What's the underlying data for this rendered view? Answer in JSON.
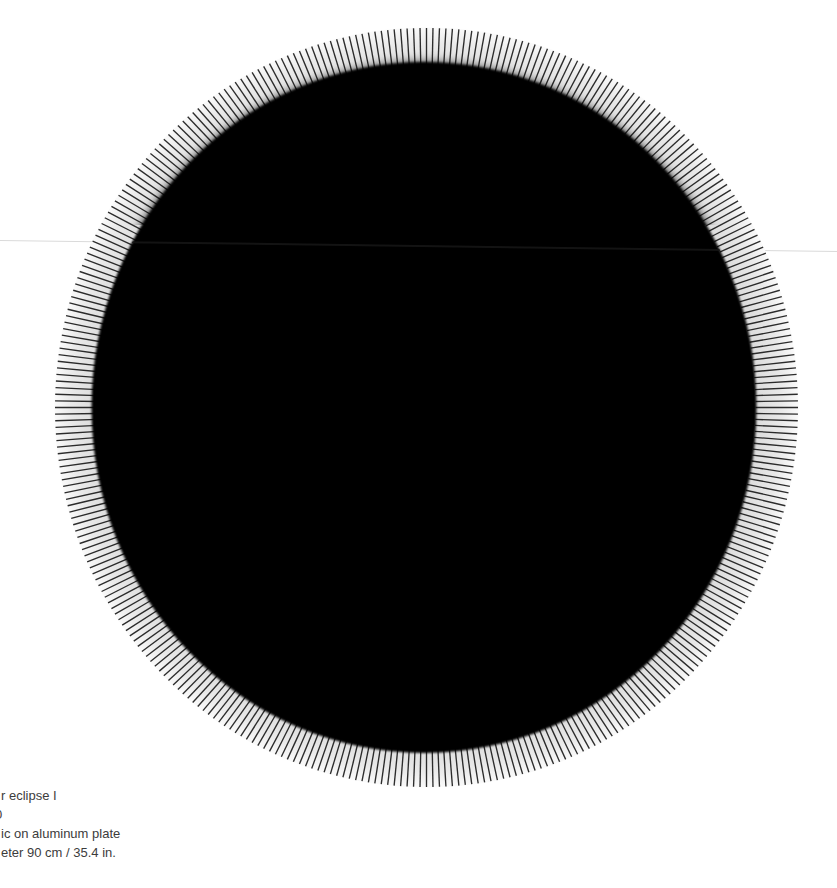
{
  "artwork": {
    "subject": "black-circular-plate-with-tick-ring",
    "tick_count": 360,
    "colors": {
      "background": "#ffffff",
      "ring_inner": "#dcdcdc",
      "ring_mid": "#e9e9e9",
      "ring_outer": "#fafafa",
      "tick": "#1b1b1b",
      "disk": "#050505",
      "seam_line": "#dadada",
      "seam_line_on_disk": "#161616",
      "caption_text": "#3c3c3c"
    }
  },
  "caption": {
    "lines": [
      "r eclipse I",
      "0",
      "ic on aluminum plate",
      "eter 90 cm / 35.4 in."
    ]
  }
}
